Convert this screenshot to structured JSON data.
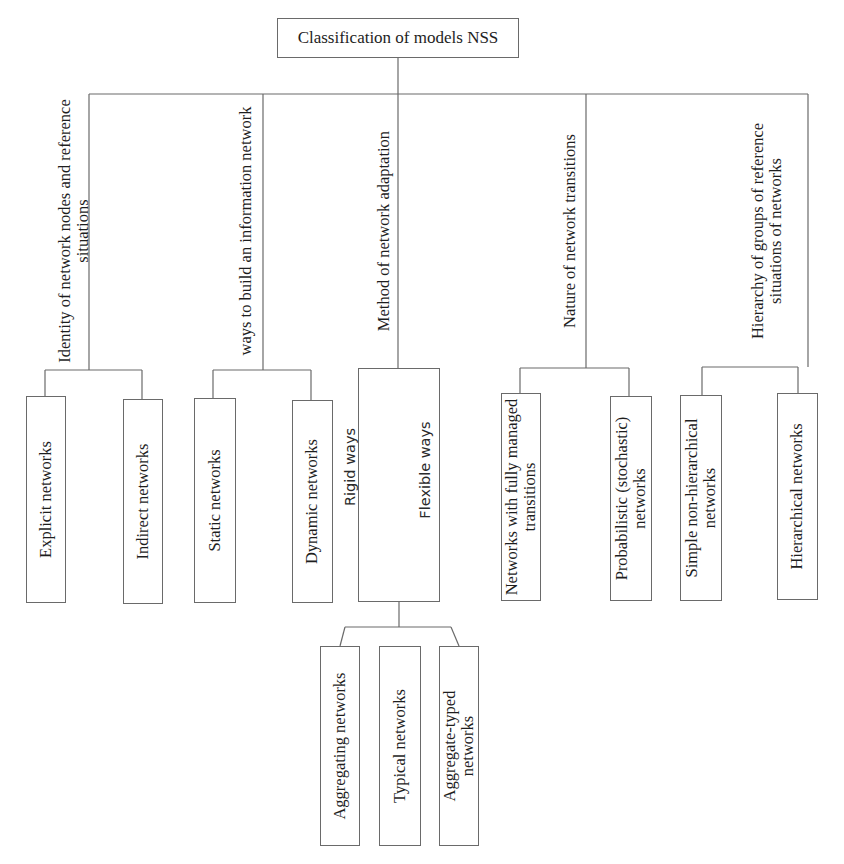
{
  "diagram": {
    "title": "Classification of models NSS",
    "categories": [
      {
        "label": "Identity of network nodes and reference situations",
        "children": [
          {
            "label": "Explicit networks"
          },
          {
            "label": "Indirect networks"
          }
        ]
      },
      {
        "label": "ways to build an information network",
        "children": [
          {
            "label": "Static networks"
          },
          {
            "label": "Dynamic networks"
          }
        ]
      },
      {
        "label": "Method of network adaptation",
        "children": [
          {
            "label": "Rigid ways"
          },
          {
            "label": "Flexible ways",
            "children": [
              {
                "label": "Aggregating networks"
              },
              {
                "label": "Typical networks"
              },
              {
                "label": "Aggregate-typed networks"
              }
            ]
          }
        ]
      },
      {
        "label": "Nature of network transitions",
        "children": [
          {
            "label": "Networks with fully managed transitions"
          },
          {
            "label": "Probabilistic (stochastic) networks"
          }
        ]
      },
      {
        "label": "Hierarchy of groups of reference situations of networks",
        "children": [
          {
            "label": "Simple non-hierarchical networks"
          },
          {
            "label": "Hierarchical networks"
          }
        ]
      }
    ]
  },
  "colors": {
    "line": "#6a6a6a",
    "text": "#1e1e1e",
    "background": "#ffffff"
  }
}
